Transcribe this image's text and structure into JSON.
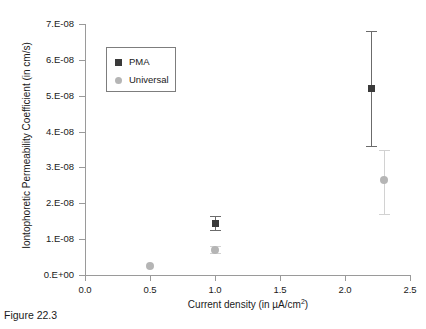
{
  "figure": {
    "caption": "Figure 22.3"
  },
  "chart_data": {
    "type": "scatter",
    "title": "",
    "xlabel": "Current density (in µA/cm²)",
    "ylabel": "Iontophoretic Permeability Coefficient (in cm/s)",
    "xlim": [
      0.0,
      2.5
    ],
    "ylim": [
      0.0,
      7e-08
    ],
    "grid": false,
    "legend_position": "upper-left-inside",
    "xticks": [
      "0.0",
      "0.5",
      "1.0",
      "1.5",
      "2.0",
      "2.5"
    ],
    "xtick_values": [
      0.0,
      0.5,
      1.0,
      1.5,
      2.0,
      2.5
    ],
    "yticks": [
      "0.E+00",
      "1.E-08",
      "2.E-08",
      "3.E-08",
      "4.E-08",
      "5.E-08",
      "6.E-08",
      "7.E-08"
    ],
    "ytick_values": [
      0,
      1e-08,
      2e-08,
      3e-08,
      4e-08,
      5e-08,
      6e-08,
      7e-08
    ],
    "series": [
      {
        "name": "PMA",
        "marker": "square",
        "color": "#3a3a3a",
        "errorbar_color": "#6b6b6b",
        "points": [
          {
            "x": 1.0,
            "y": 1.45e-08,
            "yerr_low": 1.25e-08,
            "yerr_high": 1.65e-08
          },
          {
            "x": 2.2,
            "y": 5.2e-08,
            "yerr_low": 3.6e-08,
            "yerr_high": 6.8e-08
          }
        ]
      },
      {
        "name": "Universal",
        "marker": "circle",
        "color": "#b5b5b5",
        "errorbar_color": "#d2d2d2",
        "points": [
          {
            "x": 0.5,
            "y": 2.5e-09,
            "yerr_low": 2.5e-09,
            "yerr_high": 2.5e-09
          },
          {
            "x": 1.0,
            "y": 7e-09,
            "yerr_low": 6e-09,
            "yerr_high": 8e-09
          },
          {
            "x": 2.3,
            "y": 2.65e-08,
            "yerr_low": 1.7e-08,
            "yerr_high": 3.5e-08
          }
        ]
      }
    ],
    "legend": [
      {
        "label": "PMA",
        "marker": "square",
        "color": "#3a3a3a"
      },
      {
        "label": "Universal",
        "marker": "circle",
        "color": "#b5b5b5"
      }
    ]
  }
}
